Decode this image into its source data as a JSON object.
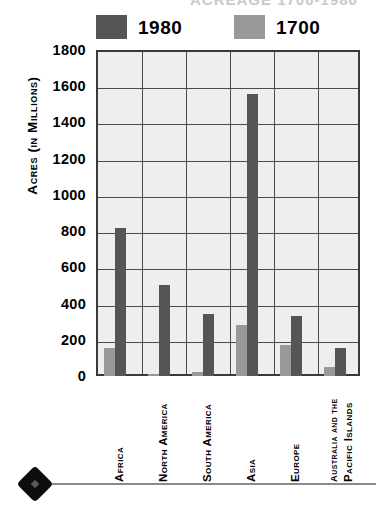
{
  "title_partial": "ACREAGE 1700-1980",
  "legend": {
    "entries": [
      {
        "label": "1980",
        "color": "#555555"
      },
      {
        "label": "1700",
        "color": "#999999"
      }
    ]
  },
  "axes": {
    "y_title": "Acres (in Millions)",
    "y_ticks": [
      "1800",
      "1600",
      "1400",
      "1200",
      "1000",
      "800",
      "600",
      "400",
      "200",
      "0"
    ]
  },
  "categories_display": [
    {
      "line1": "Africa",
      "line2": ""
    },
    {
      "line1": "North America",
      "line2": ""
    },
    {
      "line1": "South America",
      "line2": ""
    },
    {
      "line1": "Asia",
      "line2": ""
    },
    {
      "line1": "Europe",
      "line2": ""
    },
    {
      "line1": "Australia and the",
      "line2": "Pacific Islands"
    }
  ],
  "decoration": {
    "diamond": "diamond-bullet",
    "rule": "horizontal-rule"
  },
  "chart_data": {
    "type": "bar",
    "title": "ACREAGE 1700-1980",
    "xlabel": "",
    "ylabel": "Acres (in Millions)",
    "ylim": [
      0,
      1800
    ],
    "ytick_step": 200,
    "grid": true,
    "legend_position": "top",
    "categories": [
      "Africa",
      "North America",
      "South America",
      "Asia",
      "Europe",
      "Australia and the Pacific Islands"
    ],
    "series": [
      {
        "name": "1700",
        "color": "#999999",
        "values": [
          155,
          10,
          20,
          280,
          170,
          50
        ]
      },
      {
        "name": "1980",
        "color": "#555555",
        "values": [
          815,
          500,
          340,
          1555,
          330,
          155
        ]
      }
    ]
  }
}
